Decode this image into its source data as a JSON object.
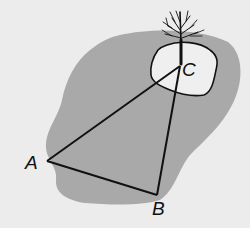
{
  "diagram": {
    "colors": {
      "background": "#ececec",
      "lake": "#a9a9a9",
      "island": "#efefef",
      "lines": "#111111"
    },
    "points": {
      "A": {
        "label": "A",
        "x": 47,
        "y": 161
      },
      "B": {
        "label": "B",
        "x": 157,
        "y": 195
      },
      "C": {
        "label": "C",
        "x": 180,
        "y": 66
      }
    },
    "segments": [
      "AB",
      "BC",
      "CA"
    ],
    "features": [
      "lake",
      "island",
      "tree"
    ]
  }
}
